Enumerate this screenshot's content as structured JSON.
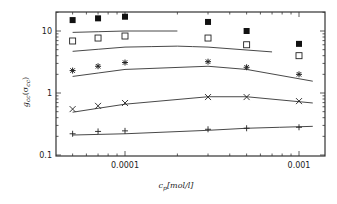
{
  "chart_data": {
    "type": "scatter",
    "title": "",
    "xlabel": "c_p[mol/l]",
    "ylabel": "g_cc(σ_cc)",
    "xscale": "log",
    "yscale": "log",
    "xlim": [
      3.5e-05,
      0.0012
    ],
    "ylim": [
      0.1,
      20
    ],
    "x_ticks": [
      {
        "value": 0.0001,
        "label": "0.0001"
      },
      {
        "value": 0.001,
        "label": "0.001"
      }
    ],
    "y_ticks": [
      {
        "value": 0.1,
        "label": "0.1"
      },
      {
        "value": 1,
        "label": "1"
      },
      {
        "value": 10,
        "label": "10"
      }
    ],
    "grid": false,
    "legend": null,
    "x": [
      5e-05,
      7e-05,
      0.0001,
      0.0003,
      0.0005,
      0.001
    ],
    "series": [
      {
        "name": "filled-square",
        "marker": "filled-square",
        "values": [
          15,
          16,
          17,
          14,
          10,
          6.2
        ]
      },
      {
        "name": "open-square",
        "marker": "open-square",
        "values": [
          6.9,
          7.7,
          8.3,
          7.7,
          6.0,
          4.0
        ]
      },
      {
        "name": "asterisk",
        "marker": "asterisk",
        "values": [
          2.3,
          2.7,
          3.1,
          3.2,
          2.6,
          2.0
        ]
      },
      {
        "name": "cross",
        "marker": "cross",
        "values": [
          0.55,
          0.62,
          0.69,
          0.86,
          0.86,
          0.74
        ]
      },
      {
        "name": "plus",
        "marker": "plus",
        "values": [
          0.22,
          0.24,
          0.245,
          0.26,
          0.27,
          0.28
        ]
      }
    ],
    "curves": [
      {
        "name": "curve-1",
        "x": [
          5e-05,
          0.0001,
          0.0002
        ],
        "values": [
          9.5,
          10,
          10
        ]
      },
      {
        "name": "curve-2",
        "x": [
          5e-05,
          0.0001,
          0.0002,
          0.0003,
          0.0007
        ],
        "values": [
          4.7,
          5.5,
          5.7,
          5.5,
          4.6
        ]
      },
      {
        "name": "curve-3",
        "x": [
          5e-05,
          0.0001,
          0.0003,
          0.0005,
          0.0012
        ],
        "values": [
          1.85,
          2.4,
          2.7,
          2.4,
          1.55
        ]
      },
      {
        "name": "curve-4",
        "x": [
          5e-05,
          0.0001,
          0.0003,
          0.0005,
          0.0012
        ],
        "values": [
          0.49,
          0.66,
          0.87,
          0.87,
          0.69
        ]
      },
      {
        "name": "curve-5",
        "x": [
          5e-05,
          0.0001,
          0.0003,
          0.0005,
          0.0012
        ],
        "values": [
          0.21,
          0.22,
          0.25,
          0.27,
          0.29
        ]
      }
    ]
  },
  "axes": {
    "x_label_main": "c",
    "x_label_sub": "p",
    "x_label_unit": "[mol/l]",
    "y_label_main": "g",
    "y_label_sub": "cc",
    "y_label_arg": "(σ",
    "y_label_arg_sub": "cc",
    "y_label_close": ")"
  }
}
